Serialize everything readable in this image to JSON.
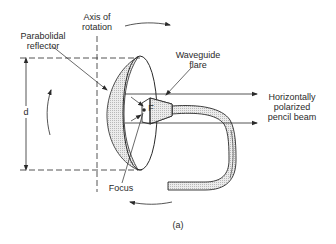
{
  "figure": {
    "caption": "(a)",
    "labels": {
      "axis_of_rotation": [
        "Axis of",
        "rotation"
      ],
      "parabolidal_reflector": [
        "Parabolidal",
        "reflector"
      ],
      "waveguide_flare": [
        "Waveguide",
        "flare"
      ],
      "beam": [
        "Horizontally",
        "polarized",
        "pencil beam"
      ],
      "d": "d",
      "focus_point": "F",
      "focus": "Focus"
    },
    "colors": {
      "line": "#2a2a2a",
      "shading": "#d9d9d9",
      "background": "#ffffff"
    }
  }
}
